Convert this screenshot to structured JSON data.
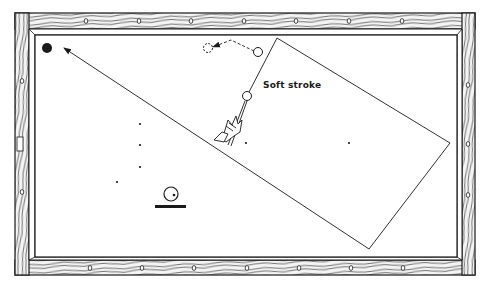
{
  "diagram": {
    "type": "billiards-table-shot-diagram",
    "annotation": "Soft stroke",
    "colors": {
      "ink": "#1a1a1a",
      "felt": "#ffffff",
      "rail_fill": "#f4f4f4"
    },
    "table": {
      "outer": {
        "x": 15,
        "y": 13,
        "w": 460,
        "h": 262
      },
      "inner": {
        "x": 35,
        "y": 35,
        "w": 422,
        "h": 222
      },
      "top_rail_diamonds": [
        86,
        139,
        191,
        244,
        296,
        349,
        402
      ],
      "bottom_rail_diamonds": [
        90,
        142,
        194,
        247,
        299,
        351,
        403
      ],
      "left_rail_diamonds": [
        81,
        192
      ],
      "right_rail_diamonds": [
        85,
        144,
        195
      ],
      "left_rail_marker": {
        "x": 17,
        "y": 137,
        "w": 6,
        "h": 14
      }
    },
    "balls": {
      "object_ball": {
        "x": 47,
        "y": 48,
        "r": 5,
        "filled": true
      },
      "cue_ball": {
        "x": 247,
        "y": 96,
        "r": 4.5
      },
      "ghost_start": {
        "x": 258,
        "y": 52,
        "r": 4.5
      },
      "ghost_end": {
        "x": 208,
        "y": 48,
        "r": 4.5,
        "dashed": true
      }
    },
    "path": {
      "points": [
        [
          249,
          92
        ],
        [
          277,
          38
        ],
        [
          450,
          143
        ],
        [
          369,
          249
        ],
        [
          64,
          48
        ]
      ],
      "arrow_tip": [
        64,
        48
      ]
    },
    "dashed_path": [
      [
        254,
        51
      ],
      [
        231,
        40
      ],
      [
        213,
        47
      ]
    ],
    "dots": [
      [
        140,
        124
      ],
      [
        140,
        145
      ],
      [
        140,
        167
      ],
      [
        117,
        182
      ],
      [
        246,
        143
      ],
      [
        349,
        143
      ]
    ],
    "spin_icon": {
      "cx": 171,
      "cy": 194,
      "r": 7,
      "dot": [
        174,
        195
      ],
      "bar": {
        "x": 155,
        "y": 205,
        "w": 31,
        "h": 3
      }
    },
    "label_position": {
      "x": 263,
      "y": 80
    }
  }
}
